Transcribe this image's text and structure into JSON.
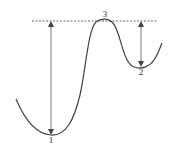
{
  "diagram": {
    "type": "potential-energy-curve",
    "colors": {
      "curve": "#444444",
      "dashed_line": "#444444",
      "arrow": "#444444",
      "label": "#333333"
    },
    "points": [
      {
        "id": "1",
        "label": "1",
        "description": "global minimum",
        "x": 51,
        "y": 135
      },
      {
        "id": "2",
        "label": "2",
        "description": "local minimum",
        "x": 141,
        "y": 67
      },
      {
        "id": "3",
        "label": "3",
        "description": "barrier maximum",
        "x": 104,
        "y": 20
      }
    ],
    "reference_line": {
      "style": "dashed",
      "y": 21,
      "x_start": 32,
      "x_end": 157
    },
    "arrows": [
      {
        "id": "barrier-from-1",
        "x": 51,
        "y_top": 21,
        "y_bottom": 135,
        "style": "double-headed"
      },
      {
        "id": "barrier-from-2",
        "x": 141,
        "y_top": 21,
        "y_bottom": 67,
        "style": "double-headed"
      }
    ]
  },
  "labels": {
    "point1": "1",
    "point2": "2",
    "point3": "3"
  }
}
